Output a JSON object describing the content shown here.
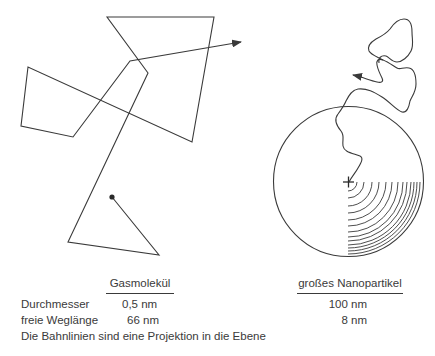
{
  "diagram": {
    "left_panel": {
      "name": "gas-molecule-trajectory",
      "description": "random walk of a gas molecule with long straight free paths",
      "start_marker": "filled-dot",
      "end_marker": "arrow"
    },
    "right_panel": {
      "name": "nanoparticle-trajectory",
      "description": "large nanoparticle drawn as circle with short tortuous path starting at its center",
      "center_marker": "cross",
      "end_marker": "arrow"
    },
    "line_color": "#3a3a3a"
  },
  "table": {
    "columns": [
      {
        "header": "Gasmolekül"
      },
      {
        "header": "großes Nanopartikel"
      }
    ],
    "rows": [
      {
        "label": "Durchmesser",
        "gas": "0,5 nm",
        "nano": "100 nm"
      },
      {
        "label": "freie Weglänge",
        "gas": "66 nm",
        "nano": "8 nm"
      }
    ],
    "footnote": "Die Bahnlinien sind eine Projektion in die Ebene"
  }
}
